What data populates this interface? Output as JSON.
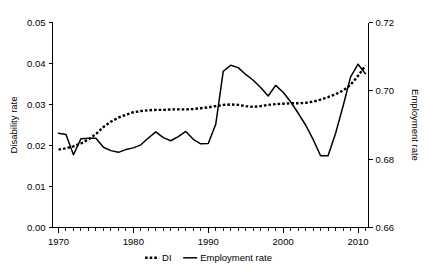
{
  "chart_data": {
    "type": "line",
    "title": "",
    "xlabel": "",
    "ylabel": "Disability rate",
    "y2label": "Employment rate",
    "xlim": [
      1969.2,
      2011.4
    ],
    "ylim": [
      0.0,
      0.05
    ],
    "y2lim": [
      0.66,
      0.72
    ],
    "grid": false,
    "legend_position": "bottom-center",
    "xticks": [
      1970,
      1980,
      1990,
      2000,
      2010
    ],
    "xtick_labels": [
      "1970",
      "1980",
      "1990",
      "2000",
      "2010"
    ],
    "xminor_step": 1,
    "yticks": [
      0.0,
      0.01,
      0.02,
      0.03,
      0.04,
      0.05
    ],
    "ytick_labels": [
      "0.00",
      "0.01",
      "0.02",
      "0.03",
      "0.04",
      "0.05"
    ],
    "y2ticks": [
      0.66,
      0.68,
      0.7,
      0.72
    ],
    "y2tick_labels": [
      "0.66",
      "0.68",
      "0.70",
      "0.72"
    ],
    "x": [
      1970,
      1971,
      1972,
      1973,
      1974,
      1975,
      1976,
      1977,
      1978,
      1979,
      1980,
      1981,
      1982,
      1983,
      1984,
      1985,
      1986,
      1987,
      1988,
      1989,
      1990,
      1991,
      1992,
      1993,
      1994,
      1995,
      1996,
      1997,
      1998,
      1999,
      2000,
      2001,
      2002,
      2003,
      2004,
      2005,
      2006,
      2007,
      2008,
      2009,
      2010,
      2011
    ],
    "series": [
      {
        "name": "DI",
        "axis": "left",
        "style": "dashed",
        "color": "#000000",
        "values": [
          0.019,
          0.0193,
          0.0198,
          0.0205,
          0.0215,
          0.0228,
          0.0245,
          0.0258,
          0.0268,
          0.0275,
          0.0281,
          0.0284,
          0.0286,
          0.0287,
          0.0287,
          0.0288,
          0.0288,
          0.0288,
          0.0289,
          0.0291,
          0.0293,
          0.0296,
          0.0299,
          0.03,
          0.0299,
          0.0296,
          0.0294,
          0.0296,
          0.0299,
          0.0301,
          0.0302,
          0.0303,
          0.0303,
          0.0304,
          0.0307,
          0.0312,
          0.0318,
          0.0325,
          0.0334,
          0.0348,
          0.037,
          0.0395
        ]
      },
      {
        "name": "Employment rate",
        "axis": "right",
        "style": "solid",
        "color": "#000000",
        "values": [
          0.6876,
          0.6872,
          0.6813,
          0.686,
          0.6861,
          0.6861,
          0.6835,
          0.6825,
          0.682,
          0.6828,
          0.6833,
          0.6842,
          0.6862,
          0.688,
          0.6863,
          0.6854,
          0.6866,
          0.6881,
          0.6858,
          0.6845,
          0.6846,
          0.6902,
          0.7057,
          0.7075,
          0.7068,
          0.7048,
          0.7031,
          0.701,
          0.6985,
          0.7016,
          0.6996,
          0.6968,
          0.6935,
          0.69,
          0.6858,
          0.681,
          0.681,
          0.6875,
          0.6955,
          0.704,
          0.7078,
          0.705
        ]
      }
    ],
    "legend": [
      {
        "label": "DI",
        "style": "dashed"
      },
      {
        "label": "Employment rate",
        "style": "solid"
      }
    ]
  }
}
